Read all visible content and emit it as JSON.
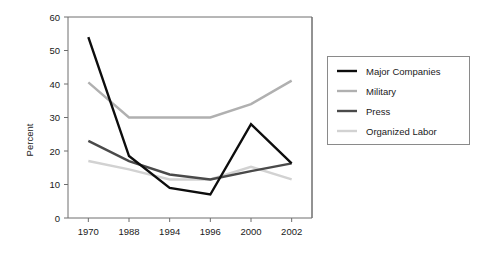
{
  "chart_data": {
    "type": "line",
    "title": "",
    "xlabel": "",
    "ylabel": "Percent",
    "categories": [
      "1970",
      "1988",
      "1994",
      "1996",
      "2000",
      "2002"
    ],
    "ylim": [
      0,
      60
    ],
    "yticks": [
      0,
      10,
      20,
      30,
      40,
      50,
      60
    ],
    "ytick_labels": [
      "0",
      "10",
      "20",
      "30",
      "40",
      "50",
      "60"
    ],
    "grid": false,
    "legend_position": "right",
    "series": [
      {
        "name": "Major Companies",
        "color": "#0d0d0d",
        "width": 2.4,
        "values": [
          54,
          18.5,
          9,
          7,
          28,
          16.3
        ]
      },
      {
        "name": "Military",
        "color": "#b0b0b0",
        "width": 2.4,
        "values": [
          40.5,
          30,
          30,
          30,
          34,
          41
        ]
      },
      {
        "name": "Press",
        "color": "#4a4a4a",
        "width": 2.4,
        "values": [
          23,
          17,
          13,
          11.5,
          14,
          16.3
        ]
      },
      {
        "name": "Organized Labor",
        "color": "#d2d2d2",
        "width": 2.4,
        "values": [
          17,
          14.5,
          11.5,
          11.5,
          15.3,
          11.5
        ]
      }
    ]
  },
  "legend": {
    "entries": [
      {
        "label": "Major Companies"
      },
      {
        "label": "Military"
      },
      {
        "label": "Press"
      },
      {
        "label": "Organized Labor"
      }
    ]
  }
}
